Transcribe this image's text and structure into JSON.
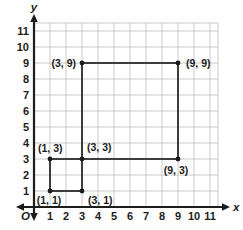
{
  "chart_data": {
    "type": "scatter",
    "title": "",
    "xlabel": "x",
    "ylabel": "y",
    "origin_label": "O",
    "xlim": [
      0,
      11.5
    ],
    "ylim": [
      0,
      11.5
    ],
    "grid": true,
    "xticks": [
      1,
      2,
      3,
      4,
      5,
      6,
      7,
      8,
      9,
      10,
      11
    ],
    "yticks": [
      1,
      2,
      3,
      4,
      5,
      6,
      7,
      8,
      9,
      10,
      11
    ],
    "points": [
      {
        "x": 1,
        "y": 1,
        "label": "(1, 1)",
        "label_pos": "below-left"
      },
      {
        "x": 3,
        "y": 1,
        "label": "(3, 1)",
        "label_pos": "below-right"
      },
      {
        "x": 1,
        "y": 3,
        "label": "(1, 3)",
        "label_pos": "above-left"
      },
      {
        "x": 3,
        "y": 3,
        "label": "(3, 3)",
        "label_pos": "above-right"
      },
      {
        "x": 3,
        "y": 9,
        "label": "(3, 9)",
        "label_pos": "left"
      },
      {
        "x": 9,
        "y": 9,
        "label": "(9, 9)",
        "label_pos": "right"
      },
      {
        "x": 9,
        "y": 3,
        "label": "(9, 3)",
        "label_pos": "below"
      }
    ],
    "shapes": [
      {
        "type": "rect",
        "name": "large-square",
        "x1": 3,
        "y1": 3,
        "x2": 9,
        "y2": 9
      },
      {
        "type": "rect",
        "name": "small-square",
        "x1": 1,
        "y1": 1,
        "x2": 3,
        "y2": 3
      }
    ],
    "colors": {
      "axis": "#1c1c1a",
      "grid": "#c9cbc8",
      "shape": "#2b2b29",
      "point": "#1c1c1a",
      "text": "#1d1d1b",
      "background": "#ffffff"
    }
  }
}
